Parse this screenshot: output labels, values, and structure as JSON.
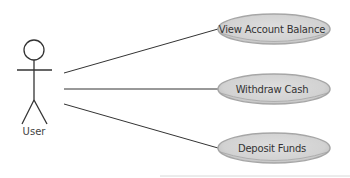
{
  "diagram": {
    "type": "uml-use-case",
    "actor": {
      "label": "User"
    },
    "use_cases": [
      {
        "label": "View Account Balance"
      },
      {
        "label": "Withdraw Cash"
      },
      {
        "label": "Deposit Funds"
      }
    ],
    "colors": {
      "ellipse_fill": "#d6d6d6",
      "ellipse_rim": "#a6a6a6",
      "line": "#333333",
      "text": "#333333"
    }
  }
}
